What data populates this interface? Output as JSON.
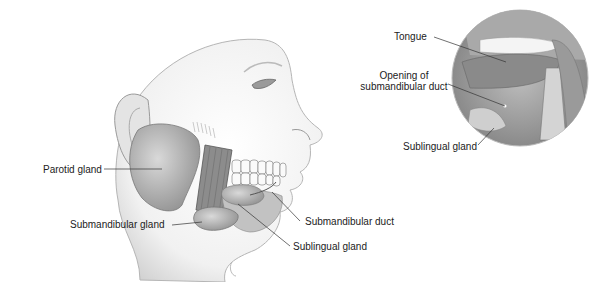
{
  "diagram": {
    "labels": {
      "parotid": "Parotid gland",
      "submandibular_gland": "Submandibular gland",
      "submandibular_duct": "Submandibular duct",
      "sublingual_gland": "Sublingual gland",
      "tongue": "Tongue",
      "opening_line1": "Opening of",
      "opening_line2": "submandibular duct",
      "inset_sublingual": "Sublingual gland"
    }
  }
}
